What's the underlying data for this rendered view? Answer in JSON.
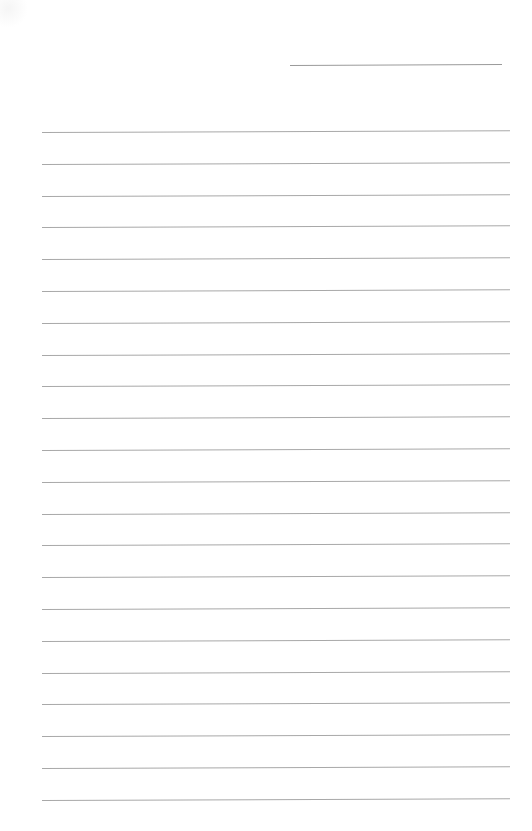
{
  "document": {
    "type": "lined-paper",
    "background_color": "#ffffff",
    "line_color": "#a8a8a8",
    "header_line": {
      "left": 290,
      "top": 65,
      "width": 212
    },
    "ruled_lines": {
      "count": 22,
      "first_top": 132,
      "spacing": 31.8,
      "left": 42,
      "width": 468
    },
    "text": ""
  }
}
